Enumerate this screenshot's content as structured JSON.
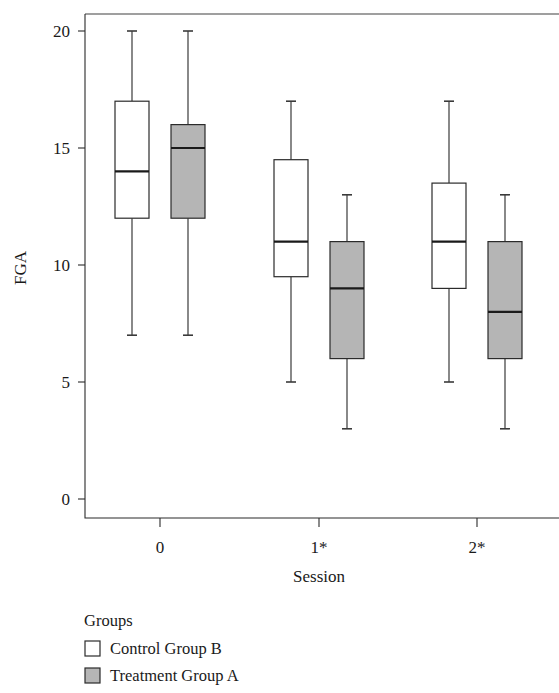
{
  "chart_data": {
    "type": "box",
    "title": "",
    "xlabel": "Session",
    "ylabel": "FGA",
    "categories": [
      "0",
      "1*",
      "2*"
    ],
    "ylim": [
      0,
      21
    ],
    "y_ticks": [
      0,
      5,
      10,
      15,
      20
    ],
    "y_tick_labels": [
      "0",
      "5",
      "10",
      "15",
      "20"
    ],
    "grid": false,
    "legend": {
      "title": "Groups",
      "position": "below-axes-left",
      "entries": [
        {
          "label": "Control Group B",
          "fill": "#ffffff"
        },
        {
          "label": "Treatment Group A",
          "fill": "#b5b5b5"
        }
      ]
    },
    "series": [
      {
        "name": "Control Group B",
        "fill": "#ffffff",
        "boxes": [
          {
            "category": "0",
            "min": 7,
            "q1": 12,
            "median": 14,
            "q3": 17,
            "max": 20
          },
          {
            "category": "1*",
            "min": 5,
            "q1": 9.5,
            "median": 11,
            "q3": 14.5,
            "max": 17
          },
          {
            "category": "2*",
            "min": 5,
            "q1": 9,
            "median": 11,
            "q3": 13.5,
            "max": 17
          }
        ]
      },
      {
        "name": "Treatment Group A",
        "fill": "#b5b5b5",
        "boxes": [
          {
            "category": "0",
            "min": 7,
            "q1": 12,
            "median": 15,
            "q3": 16,
            "max": 20
          },
          {
            "category": "1*",
            "min": 3,
            "q1": 6,
            "median": 9,
            "q3": 11,
            "max": 13
          },
          {
            "category": "2*",
            "min": 3,
            "q1": 6,
            "median": 8,
            "q3": 11,
            "max": 13
          }
        ]
      }
    ]
  },
  "axes": {
    "y_title": "FGA",
    "x_title": "Session",
    "y_tick_labels": [
      "20",
      "15",
      "10",
      "5",
      "0"
    ],
    "x_tick_labels": [
      "0",
      "1*",
      "2*"
    ]
  },
  "legend": {
    "title": "Groups",
    "item_control": "Control Group B",
    "item_treatment": "Treatment Group A"
  },
  "colors": {
    "axis": "#2b2b2b",
    "text": "#1a1a1a",
    "control_fill": "#ffffff",
    "treatment_fill": "#b5b5b5"
  }
}
